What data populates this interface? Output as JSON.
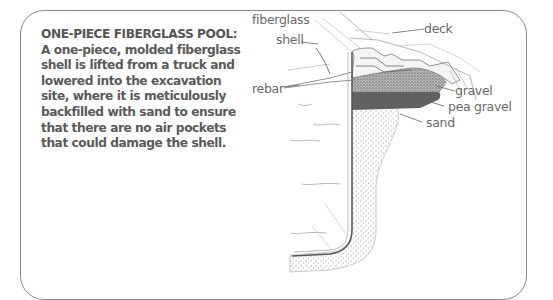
{
  "caption": {
    "heading": "ONE-PIECE FIBERGLASS POOL:",
    "body": "A one-piece, molded fiberglass shell is lifted from a truck and lowered into the excavation site, where it is meticulously backfilled with sand to ensure that there are no air pockets that could damage the shell."
  },
  "labels": {
    "fiberglass_shell_line1": "fiberglass",
    "fiberglass_shell_line2": "shell",
    "rebar": "rebar",
    "deck": "deck",
    "gravel": "gravel",
    "pea_gravel": "pea gravel",
    "sand": "sand"
  },
  "colors": {
    "text": "#5a5a5a",
    "border": "#8a8a8a",
    "label": "#6a6a6a"
  }
}
